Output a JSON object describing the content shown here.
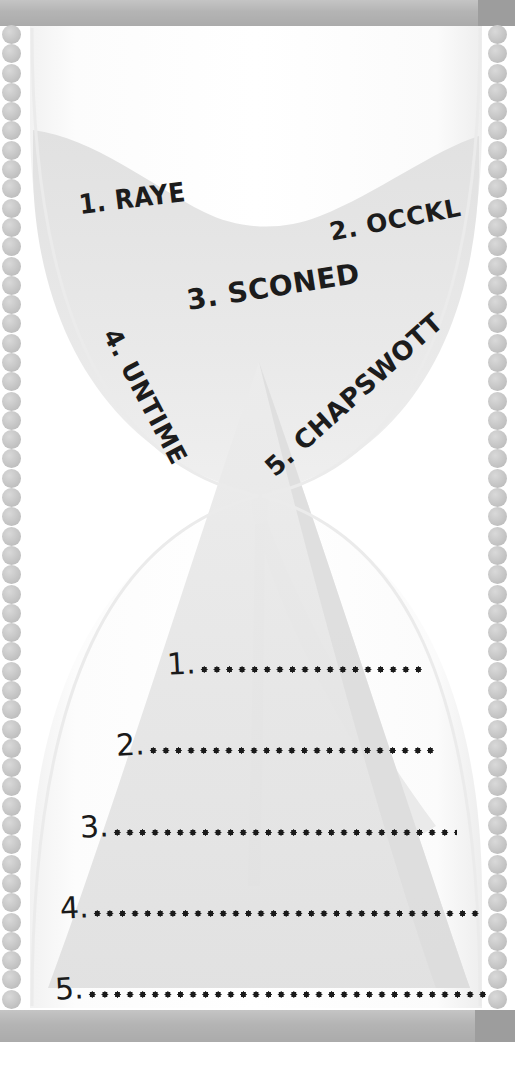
{
  "puzzle": {
    "title": "Hourglass word scramble",
    "scrambled_words": [
      {
        "index": "1.",
        "text": "1. RAYE",
        "word": "RAYE",
        "rotation_deg": -7
      },
      {
        "index": "2.",
        "text": "2. OCCKL",
        "word": "OCCKL",
        "rotation_deg": -11
      },
      {
        "index": "3.",
        "text": "3. SCONED",
        "word": "SCONED",
        "rotation_deg": -9
      },
      {
        "index": "4.",
        "text": "4. UNTIME",
        "word": "UNTIME",
        "rotation_deg": 62
      },
      {
        "index": "5.",
        "text": "5. CHAPSWOTT",
        "word": "CHAPSWOTT",
        "rotation_deg": -42
      }
    ],
    "answer_lines": [
      {
        "number": "1.",
        "dots_width_px": 228
      },
      {
        "number": "2.",
        "dots_width_px": 292
      },
      {
        "number": "3.",
        "dots_width_px": 346
      },
      {
        "number": "4.",
        "dots_width_px": 392
      },
      {
        "number": "5.",
        "dots_width_px": 400
      }
    ]
  },
  "graphic": {
    "shape": "hourglass",
    "icons": {
      "top_cap": "hourglass-top-cap",
      "bottom_cap": "hourglass-bottom-cap",
      "bead_chain_left": "bead-chain-icon",
      "bead_chain_right": "bead-chain-icon",
      "upper_bulb": "hourglass-upper-bulb",
      "lower_bulb": "hourglass-lower-bulb",
      "sand_upper": "sand-upper-mass",
      "sand_lower": "sand-lower-mound",
      "sand_stream": "sand-falling-stream",
      "neck": "hourglass-neck"
    },
    "bead_count_per_side": 51,
    "colors": {
      "cap": "#b4b4b4",
      "cap_dark_end": "#9d9d9d",
      "bead": "#c8c8c8",
      "glass_fill": "#fbfbfb",
      "glass_edge": "#ededed",
      "sand_upper": "#e3e3e3",
      "sand_lower": "#e8e8e8",
      "sand_stream": "#dcdcdc",
      "ink": "#1a1a1a",
      "page": "#ffffff"
    }
  }
}
